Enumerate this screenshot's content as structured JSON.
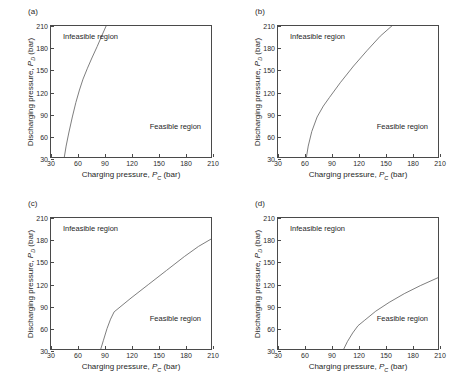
{
  "figure": {
    "axis": {
      "x_title_prefix": "Charging pressure, ",
      "x_symbol": "P",
      "x_subscript": "C",
      "x_units": " (bar)",
      "y_title_prefix": "Discharging pressure, ",
      "y_symbol": "P",
      "y_subscript": "D",
      "y_units": " (bar)",
      "xticks": [
        30,
        60,
        90,
        120,
        150,
        180,
        210
      ],
      "yticks": [
        30,
        60,
        90,
        120,
        150,
        180,
        210
      ],
      "xlim": [
        30,
        210
      ],
      "ylim": [
        30,
        210
      ]
    },
    "labels": {
      "infeasible": "Infeasible region",
      "feasible": "Feasible region"
    },
    "colors": {
      "curve": "#6d6d6d",
      "frame": "#4a4a4a",
      "text": "#1f1f1f",
      "background": "#ffffff"
    }
  },
  "chart_data": [
    {
      "type": "line",
      "panel": "(a)",
      "title": "",
      "xlabel": "Charging pressure, P_C (bar)",
      "ylabel": "Discharging pressure, P_D (bar)",
      "xlim": [
        30,
        210
      ],
      "ylim": [
        30,
        210
      ],
      "grid": false,
      "legend": "none",
      "annotations": [
        "Infeasible region",
        "Feasible region"
      ],
      "series": [
        {
          "name": "feasibility boundary",
          "x": [
            45,
            47,
            50,
            54,
            58,
            62,
            66,
            71,
            76,
            82,
            88,
            92
          ],
          "y": [
            30,
            45,
            63,
            85,
            105,
            122,
            137,
            152,
            166,
            182,
            199,
            210
          ]
        }
      ]
    },
    {
      "type": "line",
      "panel": "(b)",
      "title": "",
      "xlabel": "Charging pressure, P_C (bar)",
      "ylabel": "Discharging pressure, P_D (bar)",
      "xlim": [
        30,
        210
      ],
      "ylim": [
        30,
        210
      ],
      "grid": false,
      "legend": "none",
      "annotations": [
        "Infeasible region",
        "Feasible region"
      ],
      "series": [
        {
          "name": "feasibility boundary",
          "x": [
            62,
            64,
            68,
            74,
            81,
            88,
            100,
            115,
            130,
            145,
            158
          ],
          "y": [
            30,
            45,
            65,
            85,
            100,
            112,
            132,
            155,
            176,
            196,
            210
          ]
        }
      ]
    },
    {
      "type": "line",
      "panel": "(c)",
      "title": "",
      "xlabel": "Charging pressure, P_C (bar)",
      "ylabel": "Discharging pressure, P_D (bar)",
      "xlim": [
        30,
        210
      ],
      "ylim": [
        30,
        210
      ],
      "grid": false,
      "legend": "none",
      "annotations": [
        "Infeasible region",
        "Feasible region"
      ],
      "series": [
        {
          "name": "feasibility boundary",
          "x": [
            86,
            89,
            93,
            97,
            101,
            120,
            140,
            160,
            180,
            196,
            210
          ],
          "y": [
            30,
            42,
            58,
            71,
            81,
            100,
            119,
            138,
            157,
            171,
            181
          ]
        }
      ]
    },
    {
      "type": "line",
      "panel": "(d)",
      "title": "",
      "xlabel": "Charging pressure, P_C (bar)",
      "ylabel": "Discharging pressure, P_D (bar)",
      "xlim": [
        30,
        210
      ],
      "ylim": [
        30,
        210
      ],
      "grid": false,
      "legend": "none",
      "annotations": [
        "Infeasible region",
        "Feasible region"
      ],
      "series": [
        {
          "name": "feasibility boundary",
          "x": [
            104,
            108,
            114,
            120,
            127,
            140,
            155,
            172,
            190,
            210
          ],
          "y": [
            30,
            40,
            52,
            62,
            69,
            82,
            94,
            106,
            117,
            128
          ]
        }
      ]
    }
  ]
}
